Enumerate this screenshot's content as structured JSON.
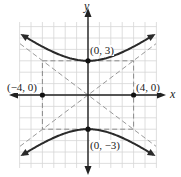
{
  "figure": {
    "colors": {
      "curve": "#2a2a2a",
      "axis": "#222222",
      "grid": "#d6d6d6",
      "dashed": "#8a8a8a",
      "point": "#111111"
    }
  },
  "axes": {
    "x_label": "x",
    "y_label": "y",
    "xlim": [
      -6,
      6
    ],
    "ylim": [
      -6,
      6
    ],
    "grid_step": 1
  },
  "points": [
    {
      "label": "(0, 3)",
      "x": 0,
      "y": 3
    },
    {
      "label": "(0, −3)",
      "x": 0,
      "y": -3
    },
    {
      "label": "(−4, 0)",
      "x": -4,
      "y": 0
    },
    {
      "label": "(4, 0)",
      "x": 4,
      "y": 0
    }
  ],
  "asymptotes": [
    {
      "equation": "y = (3/4)x"
    },
    {
      "equation": "y = -(3/4)x"
    }
  ],
  "rectangle": {
    "x_min": -4,
    "x_max": 4,
    "y_min": -3,
    "y_max": 3
  },
  "curve": {
    "type": "hyperbola",
    "a_vertical": 3,
    "b_horizontal": 4,
    "opens": "up-down"
  }
}
